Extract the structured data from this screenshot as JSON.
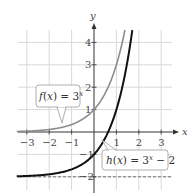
{
  "chart_data": {
    "type": "line",
    "title": "",
    "xlabel": "x",
    "ylabel": "y",
    "xlim": [
      -3.5,
      3.6
    ],
    "ylim": [
      -2.5,
      4.6
    ],
    "grid": true,
    "x_ticks": [
      "−3",
      "−2",
      "−1",
      "1",
      "2",
      "3"
    ],
    "y_ticks": [
      "−2",
      "−1",
      "1",
      "2",
      "3",
      "4"
    ],
    "series": [
      {
        "name": "f(x) = 3^x",
        "label": "f(x) = 3",
        "label_exp": "x",
        "color": "#8c8c8c",
        "x": [
          -3.5,
          -3,
          -2,
          -1,
          0,
          0.5,
          1,
          1.2,
          1.37
        ],
        "y": [
          0.02,
          0.04,
          0.11,
          0.33,
          1,
          1.73,
          3,
          3.74,
          4.5
        ]
      },
      {
        "name": "h(x) = 3^x − 2",
        "label": "h(x) = 3",
        "label_exp": "x",
        "label_tail": " − 2",
        "color": "#111111",
        "x": [
          -3.5,
          -3,
          -2,
          -1,
          0,
          0.5,
          1,
          1.5,
          1.7
        ],
        "y": [
          -1.98,
          -1.96,
          -1.89,
          -1.67,
          -1,
          -0.27,
          1,
          3.2,
          4.47
        ]
      }
    ],
    "asymptote": {
      "y": -2,
      "style": "dashed"
    }
  }
}
